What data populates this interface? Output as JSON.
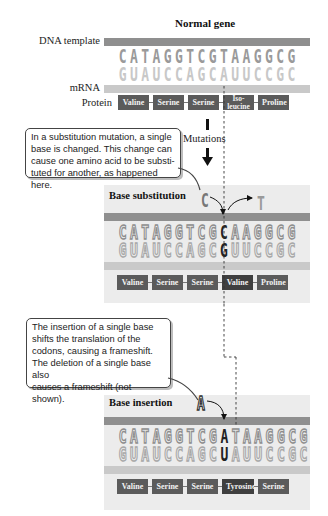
{
  "header": {
    "title": "Normal gene"
  },
  "normal": {
    "dna_label": "DNA template",
    "mrna_label": "mRNA",
    "protein_label": "Protein",
    "dna": [
      "C",
      "A",
      "T",
      "A",
      "G",
      "G",
      "T",
      "C",
      "G",
      "T",
      "A",
      "A",
      "G",
      "G",
      "C",
      "G"
    ],
    "mrna": [
      "G",
      "U",
      "A",
      "U",
      "C",
      "C",
      "A",
      "G",
      "C",
      "A",
      "U",
      "U",
      "C",
      "C",
      "G",
      "C"
    ],
    "protein": [
      "Valine",
      "Serine",
      "Serine",
      "Iso-leucine",
      "Proline"
    ],
    "protein_iso_top": "Iso-",
    "protein_iso_bottom": "leucine"
  },
  "mutations_label": "Mutations",
  "callout_substitution": "In a substitution mutation, a single base is changed. This change can cause one amino acid to be substituted for another, as happened here.",
  "callout_substitution_lines": [
    "In a substitution mutation, a single",
    "base is changed. This change can",
    "cause one amino acid to be substi-",
    "tuted for another, as happened here."
  ],
  "substitution": {
    "title": "Base substitution",
    "incoming_base": "C",
    "removed_base": "T",
    "dna": [
      "C",
      "A",
      "T",
      "A",
      "G",
      "G",
      "T",
      "C",
      "G",
      "C",
      "A",
      "A",
      "G",
      "G",
      "C",
      "G"
    ],
    "mrna": [
      "G",
      "U",
      "A",
      "U",
      "C",
      "C",
      "A",
      "G",
      "C",
      "G",
      "U",
      "U",
      "C",
      "C",
      "G",
      "C"
    ],
    "highlight_index": 9,
    "protein": [
      "Valine",
      "Serine",
      "Serine",
      "Valine",
      "Proline"
    ]
  },
  "callout_insertion_lines": [
    "The insertion of a single base",
    "shifts the translation of the",
    "codons, causing a frameshift.",
    "The deletion of a single base also",
    "causes a frameshift (not shown)."
  ],
  "insertion": {
    "title": "Base insertion",
    "incoming_base": "A",
    "dna": [
      "C",
      "A",
      "T",
      "A",
      "G",
      "G",
      "T",
      "C",
      "G",
      "A",
      "T",
      "A",
      "A",
      "G",
      "G",
      "C",
      "G"
    ],
    "mrna": [
      "G",
      "U",
      "A",
      "U",
      "C",
      "C",
      "A",
      "G",
      "C",
      "U",
      "A",
      "U",
      "U",
      "C",
      "C",
      "G",
      "C"
    ],
    "highlight_index": 9,
    "protein": [
      "Valine",
      "Serine",
      "Serine",
      "Tyrosine",
      "Serine"
    ]
  },
  "colors": {
    "dna_bar": "#8f8f8f",
    "mrna_bar": "#c9c9c9",
    "amino_box": "#5b5b5b",
    "panel_bg": "#ececec"
  }
}
